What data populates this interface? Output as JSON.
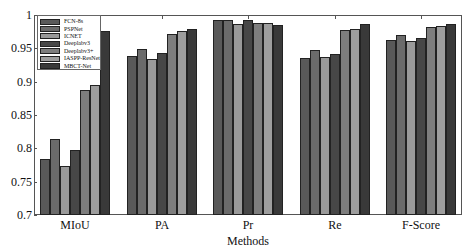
{
  "chart_data": {
    "type": "bar",
    "title": "",
    "xlabel": "Methods",
    "ylabel": "",
    "ylim": [
      0.7,
      1.0
    ],
    "yticks": [
      0.7,
      0.75,
      0.8,
      0.85,
      0.9,
      0.95,
      1
    ],
    "ytick_labels": [
      "0.7",
      "0.75",
      "0.8",
      "0.85",
      "0.9",
      "0.95",
      "1"
    ],
    "categories": [
      "MIoU",
      "PA",
      "Pr",
      "Re",
      "F-Score"
    ],
    "legend_position": "upper left",
    "grid": false,
    "series": [
      {
        "name": "FCN-8s",
        "color": "#595959",
        "values": [
          0.784,
          0.939,
          0.992,
          0.936,
          0.963
        ]
      },
      {
        "name": "PSPNet",
        "color": "#6b6b6b",
        "values": [
          0.814,
          0.949,
          0.992,
          0.948,
          0.97
        ]
      },
      {
        "name": "ICNET",
        "color": "#9a9a9a",
        "values": [
          0.773,
          0.934,
          0.987,
          0.937,
          0.961
        ]
      },
      {
        "name": "Deeplabv3",
        "color": "#474747",
        "values": [
          0.798,
          0.943,
          0.992,
          0.941,
          0.966
        ]
      },
      {
        "name": "Deeplabv3+",
        "color": "#7e7e7e",
        "values": [
          0.888,
          0.972,
          0.988,
          0.977,
          0.982
        ]
      },
      {
        "name": "IASPP-ResNet",
        "color": "#9e9e9e",
        "values": [
          0.895,
          0.976,
          0.988,
          0.979,
          0.984
        ]
      },
      {
        "name": "MBCT-Net",
        "color": "#393939",
        "values": [
          0.976,
          0.979,
          0.985,
          0.986,
          0.986
        ]
      }
    ]
  }
}
